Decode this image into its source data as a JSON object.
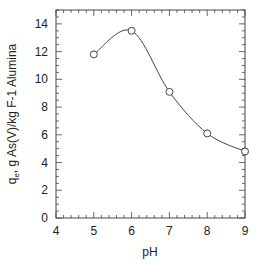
{
  "chart_data": {
    "type": "line",
    "title": "",
    "xlabel": "pH",
    "ylabel": "q_e, g As(V)/kg F-1 Alumina",
    "xlim": [
      4,
      9
    ],
    "ylim": [
      0,
      15
    ],
    "xticks": [
      4,
      5,
      6,
      7,
      8,
      9
    ],
    "yticks": [
      0,
      2,
      4,
      6,
      8,
      10,
      12,
      14
    ],
    "grid": false,
    "series": [
      {
        "name": "F-1 Alumina",
        "x": [
          5,
          6,
          7,
          8,
          9
        ],
        "values": [
          11.8,
          13.5,
          9.1,
          6.1,
          4.8
        ],
        "marker": "open-circle",
        "smooth": true
      }
    ]
  },
  "labels": {
    "xlabel": "pH",
    "ylabel_main": "q",
    "ylabel_sub": "e",
    "ylabel_rest": ", g As(V)/kg F-1 Alumina"
  }
}
